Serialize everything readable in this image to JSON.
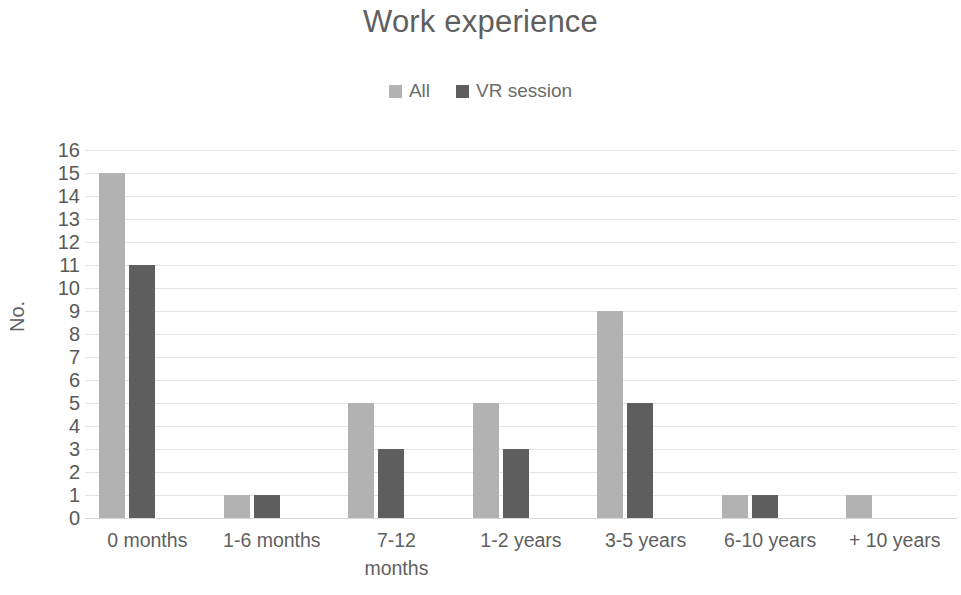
{
  "chart_data": {
    "type": "bar",
    "title": "Work experience",
    "xlabel": "",
    "ylabel": "No.",
    "ylim": [
      0,
      16
    ],
    "ytick_step": 1,
    "yticks": [
      16,
      15,
      14,
      13,
      12,
      11,
      10,
      9,
      8,
      7,
      6,
      5,
      4,
      3,
      2,
      1,
      0
    ],
    "grid": true,
    "legend_position": "top-center",
    "categories": [
      "0 months",
      "1-6 months",
      "7-12 months",
      "1-2 years",
      "3-5 years",
      "6-10 years",
      "+ 10 years"
    ],
    "category_label_lines": [
      [
        "0 months"
      ],
      [
        "1-6 months"
      ],
      [
        "7-12",
        "months"
      ],
      [
        "1-2 years"
      ],
      [
        "3-5 years"
      ],
      [
        "6-10 years"
      ],
      [
        "+ 10 years"
      ]
    ],
    "series": [
      {
        "name": "All",
        "color": "#b2b2b2",
        "values": [
          15,
          1,
          5,
          5,
          9,
          1,
          1
        ]
      },
      {
        "name": "VR session",
        "color": "#5e5e5e",
        "values": [
          11,
          1,
          3,
          3,
          5,
          1,
          0
        ]
      }
    ]
  },
  "colors": {
    "series_all": "#b2b2b2",
    "series_vr": "#5e5e5e",
    "gridline": "#dfe3ea",
    "text": "#5f5f5f",
    "background": "#ffffff"
  }
}
